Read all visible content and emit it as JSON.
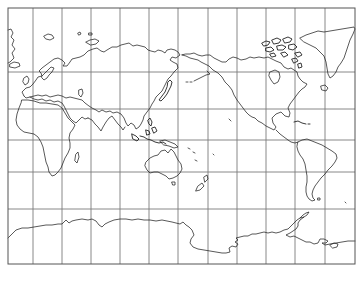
{
  "map": {
    "title": "",
    "projection": "Pacific-centered world outline map",
    "frame": {
      "x": 8,
      "y": 8,
      "width": 347,
      "height": 256,
      "stroke": "#555555"
    },
    "grid": {
      "color": "#7a7a7a",
      "vertical_lines_x": [
        33,
        62,
        91,
        120,
        149,
        178,
        208,
        237,
        266,
        295,
        325
      ],
      "horizontal_lines_y": [
        72,
        109,
        140,
        172,
        209
      ]
    },
    "coastline_color": "#222222",
    "landmasses": [
      {
        "name": "Europe",
        "region": "top-left"
      },
      {
        "name": "Africa",
        "region": "left"
      },
      {
        "name": "Asia",
        "region": "top-center-left"
      },
      {
        "name": "Australia",
        "region": "center-left"
      },
      {
        "name": "Indonesia",
        "region": "center"
      },
      {
        "name": "Japan",
        "region": "upper-center"
      },
      {
        "name": "North America",
        "region": "top-right"
      },
      {
        "name": "Greenland",
        "region": "top-right corner"
      },
      {
        "name": "South America",
        "region": "right"
      },
      {
        "name": "New Zealand",
        "region": "center-lower"
      },
      {
        "name": "Antarctica",
        "region": "bottom"
      }
    ],
    "labels": []
  }
}
